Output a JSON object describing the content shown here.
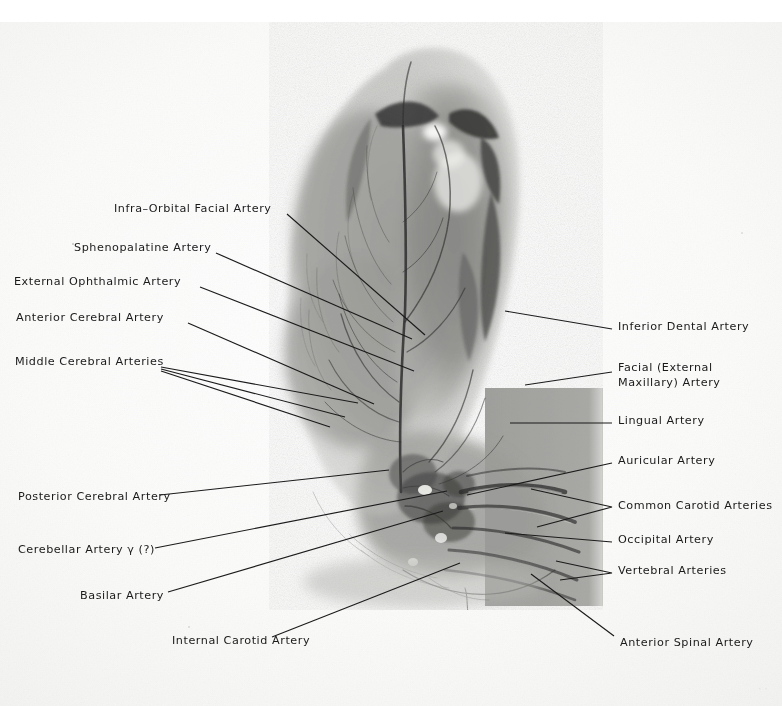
{
  "plate": {
    "type": "radiographic-angiogram-plate",
    "medium": "cerebral arteriogram photographic plate with hand-lettered annotations",
    "background_color": "#fbfbfa",
    "ink_color": "#1a1a1a",
    "film_tone": "#8d8d8d",
    "corner_caption": "· ·"
  },
  "labels_left": [
    {
      "id": "infra-orbital-facial-artery",
      "text": "Infra–Orbital Facial Artery",
      "x": 114,
      "y": 209
    },
    {
      "id": "sphenopalatine-artery",
      "text": "Sphenopalatine Artery",
      "x": 74,
      "y": 248
    },
    {
      "id": "external-ophthalmic-artery",
      "text": "External Ophthalmic Artery",
      "x": 14,
      "y": 282
    },
    {
      "id": "anterior-cerebral-artery",
      "text": "Anterior Cerebral Artery",
      "x": 16,
      "y": 318
    },
    {
      "id": "middle-cerebral-arteries",
      "text": "Middle Cerebral Arteries",
      "x": 15,
      "y": 362
    },
    {
      "id": "posterior-cerebral-artery",
      "text": "Posterior Cerebral Artery",
      "x": 18,
      "y": 497
    },
    {
      "id": "cerebellar-artery-gamma",
      "text": "Cerebellar Artery γ (?)",
      "x": 18,
      "y": 550
    },
    {
      "id": "basilar-artery",
      "text": "Basilar Artery",
      "x": 80,
      "y": 596
    },
    {
      "id": "internal-carotid-artery",
      "text": "Internal Carotid Artery",
      "x": 172,
      "y": 641
    }
  ],
  "labels_right": [
    {
      "id": "inferior-dental-artery",
      "text": "Inferior Dental Artery",
      "x": 618,
      "y": 327
    },
    {
      "id": "facial-external-maxillary-artery",
      "text": "Facial (External\nMaxillary) Artery",
      "x": 618,
      "y": 368
    },
    {
      "id": "lingual-artery",
      "text": "Lingual Artery",
      "x": 618,
      "y": 421
    },
    {
      "id": "auricular-artery",
      "text": "Auricular Artery",
      "x": 618,
      "y": 461
    },
    {
      "id": "common-carotid-arteries",
      "text": "Common Carotid Arteries",
      "x": 618,
      "y": 506
    },
    {
      "id": "occipital-artery",
      "text": "Occipital Artery",
      "x": 618,
      "y": 540
    },
    {
      "id": "vertebral-arteries",
      "text": "Vertebral Arteries",
      "x": 618,
      "y": 571
    },
    {
      "id": "anterior-spinal-artery",
      "text": "Anterior Spinal Artery",
      "x": 620,
      "y": 643
    }
  ],
  "leaders": [
    {
      "id": "leader-infra-orbital-facial",
      "points": "287,214 425,335"
    },
    {
      "id": "leader-sphenopalatine",
      "points": "216,253 412,339"
    },
    {
      "id": "leader-external-ophthalmic",
      "points": "200,287 414,371"
    },
    {
      "id": "leader-anterior-cerebral",
      "points": "188,323 374,404"
    },
    {
      "id": "leader-middle-cerebral-a",
      "points": "161,367 358,403"
    },
    {
      "id": "leader-middle-cerebral-b",
      "points": "161,369 345,417"
    },
    {
      "id": "leader-middle-cerebral-c",
      "points": "161,371 330,427"
    },
    {
      "id": "leader-posterior-cerebral",
      "points": "160,495 389,470"
    },
    {
      "id": "leader-cerebellar-gamma",
      "points": "155,548 447,491"
    },
    {
      "id": "leader-basilar",
      "points": "168,592 443,511"
    },
    {
      "id": "leader-internal-carotid",
      "points": "272,637 460,563"
    },
    {
      "id": "leader-inferior-dental",
      "points": "612,329 505,311"
    },
    {
      "id": "leader-facial-maxillary",
      "points": "612,372 525,385"
    },
    {
      "id": "leader-lingual",
      "points": "612,423 510,423"
    },
    {
      "id": "leader-auricular",
      "points": "612,463 467,495"
    },
    {
      "id": "leader-common-carotid-a",
      "points": "612,507 531,489"
    },
    {
      "id": "leader-common-carotid-b",
      "points": "612,507 537,527"
    },
    {
      "id": "leader-occipital",
      "points": "612,542 505,533"
    },
    {
      "id": "leader-vertebral-a",
      "points": "612,573 556,561"
    },
    {
      "id": "leader-vertebral-b",
      "points": "612,573 560,578"
    },
    {
      "id": "leader-anterior-spinal",
      "points": "614,636 531,574"
    }
  ],
  "film_region": {
    "left": 253,
    "top": 22,
    "width": 350,
    "height": 588,
    "note": "lateral-projection arteriogram of a head; dense vascular tree over cranial silhouette"
  }
}
